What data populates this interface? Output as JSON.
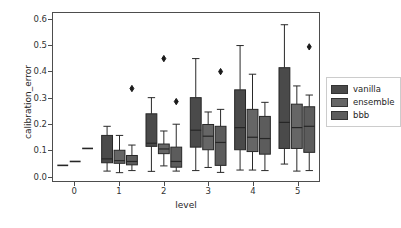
{
  "chart_data": {
    "type": "box",
    "title": "",
    "xlabel": "level",
    "ylabel": "calibration_error",
    "xlim": [
      -0.5,
      5.5
    ],
    "ylim": [
      -0.02,
      0.625
    ],
    "yticks": [
      0.0,
      0.1,
      0.2,
      0.3,
      0.4,
      0.5,
      0.6
    ],
    "ytick_labels": [
      "0.0",
      "0.1",
      "0.2",
      "0.3",
      "0.4",
      "0.5",
      "0.6"
    ],
    "xticks": [
      0,
      1,
      2,
      3,
      4,
      5
    ],
    "xtick_labels": [
      "0",
      "1",
      "2",
      "3",
      "4",
      "5"
    ],
    "grid": false,
    "legend_position": "right",
    "legend_entries": [
      "vanilla",
      "ensemble",
      "bbb"
    ],
    "series_colors": [
      "#4a4a4a",
      "#666666",
      "#5c5c5c"
    ],
    "edge_color": "#262626",
    "series": [
      {
        "name": "vanilla",
        "color": "#4a4a4a",
        "boxes": [
          {
            "level": 0,
            "whisker_low": 0.04,
            "q1": 0.04,
            "median": 0.04,
            "q3": 0.04,
            "whisker_high": 0.04,
            "outliers": []
          },
          {
            "level": 1,
            "whisker_low": 0.018,
            "q1": 0.05,
            "median": 0.065,
            "q3": 0.155,
            "whisker_high": 0.19,
            "outliers": []
          },
          {
            "level": 2,
            "whisker_low": 0.017,
            "q1": 0.113,
            "median": 0.125,
            "q3": 0.238,
            "whisker_high": 0.3,
            "outliers": []
          },
          {
            "level": 3,
            "whisker_low": 0.02,
            "q1": 0.11,
            "median": 0.175,
            "q3": 0.3,
            "whisker_high": 0.45,
            "outliers": []
          },
          {
            "level": 4,
            "whisker_low": 0.022,
            "q1": 0.1,
            "median": 0.185,
            "q3": 0.33,
            "whisker_high": 0.5,
            "outliers": []
          },
          {
            "level": 5,
            "whisker_low": 0.045,
            "q1": 0.105,
            "median": 0.205,
            "q3": 0.415,
            "whisker_high": 0.58,
            "outliers": []
          }
        ]
      },
      {
        "name": "ensemble",
        "color": "#666666",
        "boxes": [
          {
            "level": 0,
            "whisker_low": 0.055,
            "q1": 0.055,
            "median": 0.055,
            "q3": 0.055,
            "whisker_high": 0.055,
            "outliers": []
          },
          {
            "level": 1,
            "whisker_low": 0.012,
            "q1": 0.048,
            "median": 0.058,
            "q3": 0.098,
            "whisker_high": 0.155,
            "outliers": []
          },
          {
            "level": 2,
            "whisker_low": 0.038,
            "q1": 0.085,
            "median": 0.103,
            "q3": 0.122,
            "whisker_high": 0.172,
            "outliers": [
              0.45
            ]
          },
          {
            "level": 3,
            "whisker_low": 0.032,
            "q1": 0.1,
            "median": 0.152,
            "q3": 0.197,
            "whisker_high": 0.245,
            "outliers": []
          },
          {
            "level": 4,
            "whisker_low": 0.022,
            "q1": 0.093,
            "median": 0.148,
            "q3": 0.255,
            "whisker_high": 0.39,
            "outliers": []
          },
          {
            "level": 5,
            "whisker_low": 0.018,
            "q1": 0.105,
            "median": 0.185,
            "q3": 0.275,
            "whisker_high": 0.345,
            "outliers": []
          }
        ]
      },
      {
        "name": "bbb",
        "color": "#5c5c5c",
        "boxes": [
          {
            "level": 0,
            "whisker_low": 0.105,
            "q1": 0.105,
            "median": 0.105,
            "q3": 0.105,
            "whisker_high": 0.105,
            "outliers": []
          },
          {
            "level": 1,
            "whisker_low": 0.02,
            "q1": 0.042,
            "median": 0.055,
            "q3": 0.078,
            "whisker_high": 0.118,
            "outliers": [
              0.335
            ]
          },
          {
            "level": 2,
            "whisker_low": 0.018,
            "q1": 0.033,
            "median": 0.055,
            "q3": 0.11,
            "whisker_high": 0.198,
            "outliers": [
              0.285
            ]
          },
          {
            "level": 3,
            "whisker_low": 0.013,
            "q1": 0.04,
            "median": 0.128,
            "q3": 0.19,
            "whisker_high": 0.255,
            "outliers": [
              0.4
            ]
          },
          {
            "level": 4,
            "whisker_low": 0.02,
            "q1": 0.083,
            "median": 0.143,
            "q3": 0.228,
            "whisker_high": 0.282,
            "outliers": []
          },
          {
            "level": 5,
            "whisker_low": 0.02,
            "q1": 0.09,
            "median": 0.19,
            "q3": 0.265,
            "whisker_high": 0.31,
            "outliers": [
              0.495
            ]
          }
        ]
      }
    ]
  }
}
